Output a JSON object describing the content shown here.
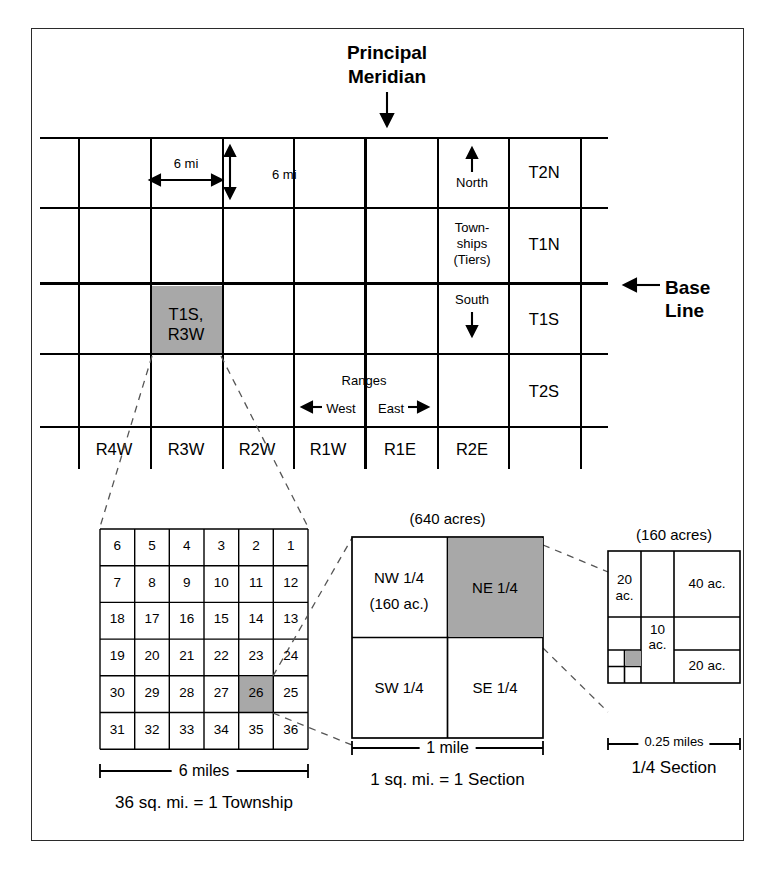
{
  "diagram": {
    "principal_meridian_label": "Principal\nMeridian",
    "principal_meridian_line1": "Principal",
    "principal_meridian_line2": "Meridian",
    "base_line_line1": "Base",
    "base_line_line2": "Line",
    "shade_color": "#a8a8a8",
    "line_color": "#000000"
  },
  "township_grid": {
    "dim_horizontal_label": "6 mi",
    "dim_vertical_label": "6 mi",
    "north_label": "North",
    "south_label": "South",
    "townships_label_line1": "Town-",
    "townships_label_line2": "ships",
    "townships_label_line3": "(Tiers)",
    "ranges_label": "Ranges",
    "west_label": "West",
    "east_label": "East",
    "highlighted_cell_line1": "T1S,",
    "highlighted_cell_line2": "R3W",
    "tier_labels": [
      "T2N",
      "T1N",
      "T1S",
      "T2S"
    ],
    "range_labels": [
      "R4W",
      "R3W",
      "R2W",
      "R1W",
      "R1E",
      "R2E"
    ]
  },
  "section_grid": {
    "caption_scale": "6 miles",
    "caption_title": "36 sq. mi. = 1 Township",
    "highlighted_section": "23",
    "rows": [
      [
        "6",
        "5",
        "4",
        "3",
        "2",
        "1"
      ],
      [
        "7",
        "8",
        "9",
        "10",
        "11",
        "12"
      ],
      [
        "18",
        "17",
        "16",
        "15",
        "14",
        "13"
      ],
      [
        "19",
        "20",
        "21",
        "22",
        "23",
        "24"
      ],
      [
        "30",
        "29",
        "28",
        "27",
        "26",
        "25"
      ],
      [
        "31",
        "32",
        "33",
        "34",
        "35",
        "36"
      ]
    ]
  },
  "section_detail": {
    "acreage_header": "(640 acres)",
    "caption_scale": "1 mile",
    "caption_title": "1 sq. mi. = 1 Section",
    "highlighted_quarter": "NE 1/4",
    "quarters": [
      {
        "label": "NW 1/4",
        "sublabel": "(160 ac.)"
      },
      {
        "label": "NE 1/4",
        "sublabel": ""
      },
      {
        "label": "SW 1/4",
        "sublabel": ""
      },
      {
        "label": "SE 1/4",
        "sublabel": ""
      }
    ]
  },
  "quarter_detail": {
    "acreage_header": "(160 acres)",
    "caption_scale": "0.25 miles",
    "caption_title": "1/4 Section",
    "parcels": [
      {
        "name": "20-acre-west",
        "line1": "20",
        "line2": "ac."
      },
      {
        "name": "40-acre-northeast",
        "line1": "40 ac.",
        "line2": ""
      },
      {
        "name": "10-acre-center",
        "line1": "10",
        "line2": "ac."
      },
      {
        "name": "20-acre-southeast",
        "line1": "20 ac.",
        "line2": ""
      }
    ]
  }
}
